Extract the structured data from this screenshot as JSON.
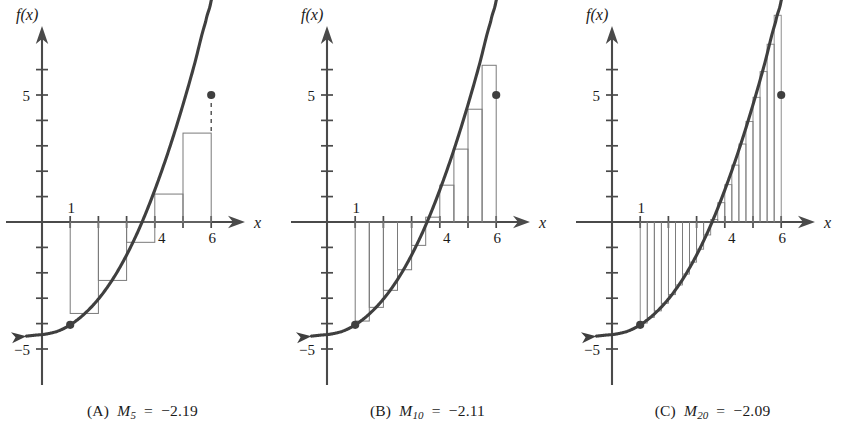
{
  "figure": {
    "title": "",
    "panel_count": 3
  },
  "chart_data": [
    {
      "type": "area",
      "panel": "A",
      "title": "",
      "subtitle": "",
      "xlabel": "x",
      "ylabel": "f(x)",
      "xlim": [
        -1.6,
        7.6
      ],
      "ylim": [
        -6.6,
        6.8
      ],
      "grid": false,
      "legend": "none",
      "x_ticks": [
        1,
        2,
        3,
        4,
        5,
        6
      ],
      "x_tick_labels": [
        "1",
        "",
        "",
        "4",
        "",
        "6"
      ],
      "y_ticks": [
        -5,
        -4,
        -3,
        -2,
        -1,
        1,
        2,
        3,
        4,
        5,
        6
      ],
      "y_tick_labels": [
        "-5",
        "",
        "",
        "",
        "",
        "",
        "",
        "",
        "",
        "5",
        ""
      ],
      "series": [
        {
          "name": "f(x)",
          "kind": "curve",
          "x": [
            -0.2,
            0.2,
            0.6,
            1.0,
            1.4,
            1.8,
            2.2,
            2.6,
            3.0,
            3.4,
            3.8,
            4.2,
            4.6,
            5.0,
            5.4,
            5.8,
            6.0,
            6.4
          ],
          "y": [
            -4.45,
            -4.4,
            -4.28,
            -4.05,
            -3.72,
            -3.29,
            -2.75,
            -2.09,
            -1.3,
            -0.38,
            0.68,
            1.87,
            3.18,
            4.62,
            6.18,
            7.86,
            8.73,
            10.6
          ]
        },
        {
          "name": "midpoint rectangles",
          "kind": "rectangles",
          "n": 5,
          "interval": [
            1,
            6
          ],
          "width": 1,
          "midpoints": [
            1.5,
            2.5,
            3.5,
            4.5,
            5.5
          ],
          "heights": [
            -3.6,
            -2.3,
            -0.8,
            1.1,
            3.5
          ]
        }
      ],
      "markers": [
        {
          "label": "left endpoint",
          "x": 1,
          "y": -4.05
        },
        {
          "label": "right endpoint",
          "x": 6,
          "y": 5.0
        }
      ],
      "annotations": [
        {
          "label": "dashed drop line at x = 6",
          "x": 6,
          "y_from": 5.0,
          "y_to": 3.5
        }
      ]
    },
    {
      "type": "area",
      "panel": "B",
      "title": "",
      "subtitle": "",
      "xlabel": "x",
      "ylabel": "f(x)",
      "xlim": [
        -1.6,
        7.6
      ],
      "ylim": [
        -6.6,
        6.8
      ],
      "grid": false,
      "legend": "none",
      "x_ticks": [
        1,
        2,
        3,
        4,
        5,
        6
      ],
      "x_tick_labels": [
        "1",
        "",
        "",
        "4",
        "",
        "6"
      ],
      "y_ticks": [
        -5,
        -4,
        -3,
        -2,
        -1,
        1,
        2,
        3,
        4,
        5,
        6
      ],
      "y_tick_labels": [
        "-5",
        "",
        "",
        "",
        "",
        "",
        "",
        "",
        "",
        "5",
        ""
      ],
      "series": [
        {
          "name": "f(x)",
          "kind": "curve",
          "x": [
            -0.2,
            0.2,
            0.6,
            1.0,
            1.4,
            1.8,
            2.2,
            2.6,
            3.0,
            3.4,
            3.8,
            4.2,
            4.6,
            5.0,
            5.4,
            5.8,
            6.0,
            6.4
          ],
          "y": [
            -4.45,
            -4.4,
            -4.28,
            -4.05,
            -3.72,
            -3.29,
            -2.75,
            -2.09,
            -1.3,
            -0.38,
            0.68,
            1.87,
            3.18,
            4.62,
            6.18,
            7.86,
            8.73,
            10.6
          ]
        },
        {
          "name": "midpoint rectangles",
          "kind": "rectangles",
          "n": 10,
          "interval": [
            1,
            6
          ],
          "width": 0.5,
          "midpoints": [
            1.25,
            1.75,
            2.25,
            2.75,
            3.25,
            3.75,
            4.25,
            4.75,
            5.25,
            5.75
          ],
          "heights": [
            -3.9,
            -3.36,
            -2.69,
            -1.88,
            -0.92,
            0.19,
            1.45,
            2.87,
            4.44,
            6.17
          ]
        }
      ],
      "markers": [
        {
          "label": "left endpoint",
          "x": 1,
          "y": -4.05
        },
        {
          "label": "right endpoint",
          "x": 6,
          "y": 5.0
        }
      ],
      "annotations": []
    },
    {
      "type": "area",
      "panel": "C",
      "title": "",
      "subtitle": "",
      "xlabel": "x",
      "ylabel": "f(x)",
      "xlim": [
        -1.6,
        7.6
      ],
      "ylim": [
        -6.6,
        6.8
      ],
      "grid": false,
      "legend": "none",
      "x_ticks": [
        1,
        2,
        3,
        4,
        5,
        6
      ],
      "x_tick_labels": [
        "1",
        "",
        "",
        "4",
        "",
        "6"
      ],
      "y_ticks": [
        -5,
        -4,
        -3,
        -2,
        -1,
        1,
        2,
        3,
        4,
        5,
        6
      ],
      "y_tick_labels": [
        "-5",
        "",
        "",
        "",
        "",
        "",
        "",
        "",
        "",
        "5",
        ""
      ],
      "series": [
        {
          "name": "f(x)",
          "kind": "curve",
          "x": [
            -0.2,
            0.2,
            0.6,
            1.0,
            1.4,
            1.8,
            2.2,
            2.6,
            3.0,
            3.4,
            3.8,
            4.2,
            4.6,
            5.0,
            5.4,
            5.8,
            6.0,
            6.4
          ],
          "y": [
            -4.45,
            -4.4,
            -4.28,
            -4.05,
            -3.72,
            -3.29,
            -2.75,
            -2.09,
            -1.3,
            -0.38,
            0.68,
            1.87,
            3.18,
            4.62,
            6.18,
            7.86,
            8.73,
            10.6
          ]
        },
        {
          "name": "midpoint rectangles",
          "kind": "rectangles",
          "n": 20,
          "interval": [
            1,
            6
          ],
          "width": 0.25,
          "midpoints": [
            1.125,
            1.375,
            1.625,
            1.875,
            2.125,
            2.375,
            2.625,
            2.875,
            3.125,
            3.375,
            3.625,
            3.875,
            4.125,
            4.375,
            4.625,
            4.875,
            5.125,
            5.375,
            5.625,
            5.875
          ],
          "heights": [
            -3.98,
            -3.76,
            -3.5,
            -3.2,
            -2.86,
            -2.48,
            -2.05,
            -1.58,
            -1.07,
            -0.51,
            0.1,
            0.76,
            1.47,
            2.24,
            3.07,
            3.96,
            4.91,
            5.92,
            7.0,
            8.14
          ]
        }
      ],
      "markers": [
        {
          "label": "left endpoint",
          "x": 1,
          "y": -4.05
        },
        {
          "label": "right endpoint",
          "x": 6,
          "y": 5.0
        }
      ],
      "annotations": []
    }
  ],
  "panels": [
    {
      "id": "A",
      "caption_tag": "(A)",
      "caption_symbol": "M",
      "caption_subscript": "5",
      "caption_equals": "=",
      "caption_value": "−2.19",
      "caption_full": "(A) M₅ = −2.19",
      "y_axis_label": "f(x)",
      "x_axis_label": "x",
      "x_labels": [
        {
          "text": "1",
          "x": 1
        },
        {
          "text": "4",
          "x": 4
        },
        {
          "text": "6",
          "x": 6
        }
      ],
      "y_labels": [
        {
          "text": "5",
          "y": 5
        },
        {
          "text": "−5",
          "y": -5
        }
      ]
    },
    {
      "id": "B",
      "caption_tag": "(B)",
      "caption_symbol": "M",
      "caption_subscript": "10",
      "caption_equals": "=",
      "caption_value": "−2.11",
      "caption_full": "(B) M₁₀ = −2.11",
      "y_axis_label": "f(x)",
      "x_axis_label": "x",
      "x_labels": [
        {
          "text": "1",
          "x": 1
        },
        {
          "text": "4",
          "x": 4
        },
        {
          "text": "6",
          "x": 6
        }
      ],
      "y_labels": [
        {
          "text": "5",
          "y": 5
        },
        {
          "text": "−5",
          "y": -5
        }
      ]
    },
    {
      "id": "C",
      "caption_tag": "(C)",
      "caption_symbol": "M",
      "caption_subscript": "20",
      "caption_equals": "=",
      "caption_value": "−2.09",
      "caption_full": "(C) M₂₀ = −2.09",
      "y_axis_label": "f(x)",
      "x_axis_label": "x",
      "x_labels": [
        {
          "text": "1",
          "x": 1
        },
        {
          "text": "4",
          "x": 4
        },
        {
          "text": "6",
          "x": 6
        }
      ],
      "y_labels": [
        {
          "text": "5",
          "y": 5
        },
        {
          "text": "−5",
          "y": -5
        }
      ]
    }
  ],
  "colors": {
    "curve": "#3f3f3f",
    "axis": "#4a4a4a",
    "rectangle_stroke": "#7a7a7a",
    "text": "#1a1a1a",
    "background": "#ffffff",
    "marker": "#3f3f3f"
  }
}
